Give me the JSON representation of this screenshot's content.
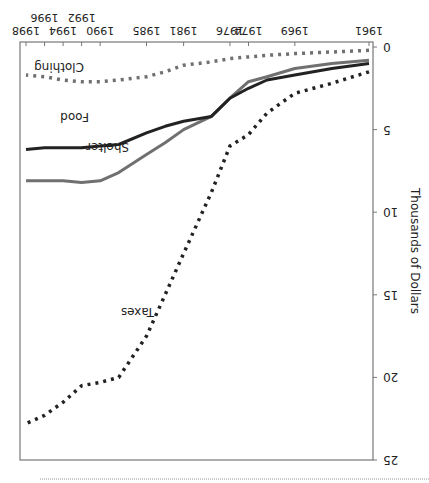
{
  "chart_data": {
    "type": "line",
    "title": "",
    "xlabel": "",
    "ylabel": "Thousands of Dollars",
    "ylim": [
      0,
      25
    ],
    "yticks": [
      0,
      5,
      10,
      15,
      20,
      25
    ],
    "xticks": [
      "1961",
      "1969",
      "1974",
      "1976",
      "1981",
      "1985",
      "1990",
      "1992",
      "1994",
      "1996",
      "1998"
    ],
    "grid": false,
    "legend": "inline labels",
    "orientation_note": "figure displayed rotated 180 degrees",
    "x": [
      1961,
      1965,
      1969,
      1972,
      1974,
      1976,
      1978,
      1981,
      1983,
      1985,
      1988,
      1990,
      1992,
      1994,
      1996,
      1998
    ],
    "series": [
      {
        "name": "Taxes",
        "style": "dotted",
        "color": "#222222",
        "values": [
          1.5,
          2.2,
          2.8,
          4.0,
          5.3,
          6.0,
          8.8,
          12.5,
          15.0,
          17.5,
          20.0,
          20.3,
          20.5,
          21.5,
          22.3,
          22.8
        ]
      },
      {
        "name": "Shelter",
        "style": "solid",
        "color": "#707070",
        "values": [
          0.8,
          1.0,
          1.3,
          1.8,
          2.1,
          3.1,
          4.2,
          5.0,
          5.8,
          6.5,
          7.6,
          8.1,
          8.2,
          8.1,
          8.1,
          8.1
        ]
      },
      {
        "name": "Food",
        "style": "solid",
        "color": "#222222",
        "values": [
          1.0,
          1.3,
          1.7,
          2.0,
          2.5,
          3.1,
          4.2,
          4.5,
          4.8,
          5.2,
          5.9,
          6.0,
          6.1,
          6.1,
          6.1,
          6.2
        ]
      },
      {
        "name": "Clothing",
        "style": "dotted",
        "color": "#707070",
        "values": [
          0.2,
          0.3,
          0.4,
          0.5,
          0.6,
          0.7,
          0.9,
          1.1,
          1.5,
          1.8,
          2.0,
          2.1,
          2.1,
          2.0,
          1.8,
          1.7
        ]
      }
    ],
    "labels": {
      "taxes": "Taxes",
      "shelter": "Shelter",
      "food": "Food",
      "clothing": "Clothing"
    }
  }
}
